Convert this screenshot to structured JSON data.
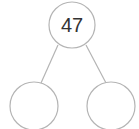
{
  "diagram": {
    "type": "number-bond",
    "whole": {
      "value": "47"
    },
    "parts": [
      {
        "value": ""
      },
      {
        "value": ""
      }
    ],
    "colors": {
      "stroke": "#b4b4b4",
      "text": "#333333",
      "background": "#ffffff"
    }
  }
}
